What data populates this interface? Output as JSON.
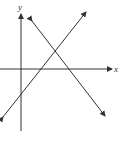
{
  "diagram": {
    "type": "coordinate-plane-two-lines",
    "axes": {
      "x_label": "x",
      "y_label": "y",
      "origin_px": [
        21,
        69
      ]
    },
    "lines": [
      {
        "name": "line-positive-slope",
        "from_px": [
          3,
          117
        ],
        "to_px": [
          86,
          12
        ],
        "slope_sign": "positive",
        "arrows": "both"
      },
      {
        "name": "line-negative-slope",
        "from_px": [
          32,
          21
        ],
        "to_px": [
          105,
          116
        ],
        "slope_sign": "negative",
        "arrows": "both"
      }
    ],
    "colors": {
      "axes": "#333333",
      "lines": "#333333",
      "background": "#ffffff"
    }
  }
}
